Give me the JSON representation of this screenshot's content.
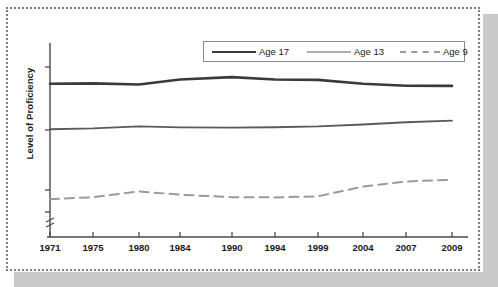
{
  "figure": {
    "background_color": "#ffffff",
    "frame_style": "dotted",
    "frame_color": "#7d7d7d",
    "shadow_color": "#c9c9c9"
  },
  "legend": {
    "position": "top-right-inside",
    "border_color": "#8a8a8a",
    "entries": [
      {
        "label": "Age 17",
        "color": "#3a3a3a",
        "style": "solid",
        "width": 2.6
      },
      {
        "label": "Age 13",
        "color": "#5a5a5a",
        "style": "solid",
        "width": 1.9
      },
      {
        "label": "Age 9",
        "color": "#9a9a9a",
        "style": "dashed",
        "width": 2.0
      }
    ]
  },
  "axes": {
    "y_axis_label": "Level of Proficiency",
    "y_axis_has_numeric_ticks": false,
    "y_axis_break_marker": true,
    "x_axis_label": ""
  },
  "chart_data": {
    "type": "line",
    "title": "",
    "xlabel": "",
    "ylabel": "Level of Proficiency",
    "grid": false,
    "legend_position": "top right",
    "categories": [
      "1971",
      "1975",
      "1980",
      "1984",
      "1990",
      "1994",
      "1999",
      "2004",
      "2007",
      "2009"
    ],
    "x": [
      1971,
      1975,
      1980,
      1984,
      1990,
      1994,
      1999,
      2004,
      2007,
      2009
    ],
    "xlim": [
      1971,
      2009
    ],
    "ylim": [
      0,
      100
    ],
    "y_tick_labels": [],
    "series": [
      {
        "name": "Age 17",
        "color": "#3a3a3a",
        "style": "solid",
        "values": [
          79.0,
          79.2,
          78.6,
          81.2,
          82.4,
          81.2,
          81.0,
          79.0,
          78.0,
          77.9
        ]
      },
      {
        "name": "Age 13",
        "color": "#5a5a5a",
        "style": "solid",
        "values": [
          55.5,
          56.0,
          57.0,
          56.5,
          56.4,
          56.6,
          57.0,
          58.0,
          59.2,
          60.0
        ]
      },
      {
        "name": "Age 9",
        "color": "#9a9a9a",
        "style": "dashed",
        "values": [
          19.5,
          20.5,
          23.5,
          21.8,
          20.5,
          20.4,
          21.0,
          26.0,
          28.6,
          29.5
        ]
      }
    ]
  }
}
